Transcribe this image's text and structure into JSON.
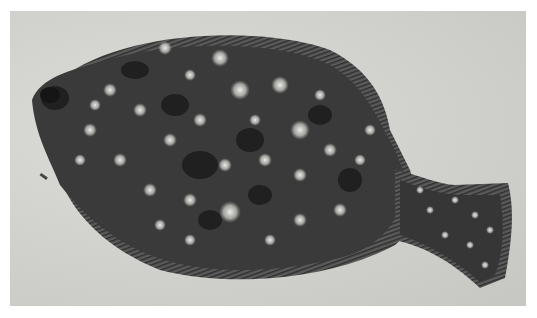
{
  "image": {
    "subject": "flatfish",
    "description": "Black-and-white photograph of a spotted flounder lying on sand",
    "colors": {
      "border": "#ffffff",
      "sand": "#cfcfcb",
      "fish_body": "#3a3a3a",
      "fish_dark_blotch": "#1c1c1c",
      "spots": "#d8d8d8",
      "fin": "#5a5a5a"
    }
  }
}
